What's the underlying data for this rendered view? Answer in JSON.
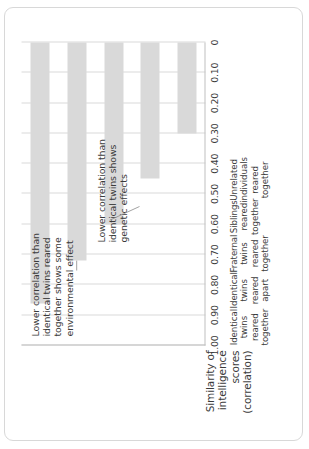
{
  "chart_data": {
    "type": "bar",
    "orientation": "horizontal-rotated",
    "title": "",
    "xlabel": "",
    "ylabel": "Similarity of intelligence scores (correlation)",
    "ylabel_lines": [
      "Similarity of",
      "intelligence",
      "scores",
      "(correlation)"
    ],
    "ylim": [
      0,
      1.0
    ],
    "grid": true,
    "legend": "none",
    "tick_labels": [
      "1.00",
      "0.90",
      "0.80",
      "0.70",
      "0.60",
      "0.50",
      "0.40",
      "0.30",
      "0.20",
      "0.10",
      "0"
    ],
    "tick_values": [
      1.0,
      0.9,
      0.8,
      0.7,
      0.6,
      0.5,
      0.4,
      0.3,
      0.2,
      0.1,
      0
    ],
    "categories": [
      "Identical twins reared together",
      "Identical twins reared apart",
      "Fraternal twins reared together",
      "Siblings reared together",
      "Unrelated individuals reared together"
    ],
    "category_lines": [
      [
        "Identical",
        "twins",
        "reared",
        "together"
      ],
      [
        "Identical",
        "twins",
        "reared",
        "apart"
      ],
      [
        "Fraternal",
        "twins",
        "reared",
        "together"
      ],
      [
        "Siblings",
        "reared",
        "together"
      ],
      [
        "Unrelated",
        "individuals",
        "reared",
        "together"
      ]
    ],
    "values": [
      0.86,
      0.72,
      0.6,
      0.45,
      0.3
    ],
    "bar_color": "#d9d9d9",
    "grid_color": "#d9d9d9",
    "axis_color": "#bfbfbf",
    "text_color": "#3b3b3b",
    "annotations": [
      {
        "id": "environmental",
        "text": "Lower correlation than identical twins reared together shows some environmental effect",
        "lines": [
          "Lower correlation than",
          "identical twins reared",
          "together shows some",
          "environmental effect"
        ],
        "points_to_category": "Identical twins reared apart"
      },
      {
        "id": "genetic",
        "text": "Lower correlation than identical twins shows genetic effects",
        "lines": [
          "Lower correlation than",
          "identical twins shows",
          "genetic effects"
        ],
        "points_to_category": "Fraternal twins reared together"
      }
    ]
  }
}
